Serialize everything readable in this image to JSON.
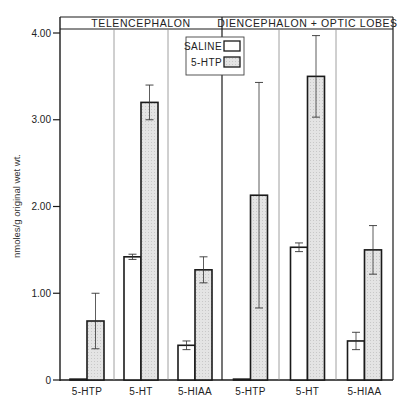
{
  "chart_data": {
    "type": "bar",
    "title": "",
    "ylabel": "nmoles/g original wet wt.",
    "xlabel": "",
    "ylim": [
      0,
      4.0
    ],
    "yticks": [
      {
        "value": 0,
        "label": "0"
      },
      {
        "value": 1.0,
        "label": "1.00"
      },
      {
        "value": 2.0,
        "label": "2.00"
      },
      {
        "value": 3.0,
        "label": "3.00"
      },
      {
        "value": 4.0,
        "label": "4.00"
      }
    ],
    "grid": false,
    "legend": {
      "position": "upper-center",
      "entries": [
        "SALINE",
        "5-HTP"
      ]
    },
    "panels": [
      {
        "title": "TELENCEPHALON",
        "categories": [
          "5-HTP",
          "5-HT",
          "5-HIAA"
        ],
        "series": [
          {
            "name": "SALINE",
            "values": [
              0.01,
              1.42,
              0.4
            ],
            "errors": [
              0,
              0.03,
              0.05
            ]
          },
          {
            "name": "5-HTP",
            "values": [
              0.68,
              3.2,
              1.27
            ],
            "errors": [
              0.32,
              0.2,
              0.15
            ]
          }
        ]
      },
      {
        "title": "DIENCEPHALON + OPTIC LOBES",
        "categories": [
          "5-HTP",
          "5-HT",
          "5-HIAA"
        ],
        "series": [
          {
            "name": "SALINE",
            "values": [
              0.01,
              1.53,
              0.45
            ],
            "errors": [
              0,
              0.05,
              0.1
            ]
          },
          {
            "name": "5-HTP",
            "values": [
              2.13,
              3.5,
              1.5
            ],
            "errors": [
              1.3,
              0.47,
              0.28
            ]
          }
        ]
      }
    ]
  },
  "colors": {
    "saline_fill": "#ffffff",
    "htp_fill": "#e4e4e4",
    "stroke": "#1a1a1a",
    "divider": "#888888"
  }
}
